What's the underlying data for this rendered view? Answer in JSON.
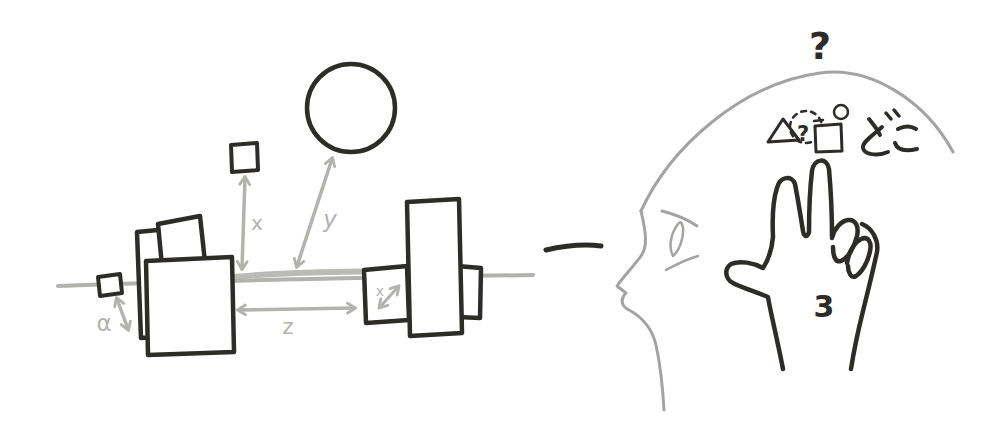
{
  "colors": {
    "ink": "#2e2c29",
    "sketch_gray": "#b2b2af",
    "head_gray": "#a3a3a1",
    "background": "#ffffff"
  },
  "scene": {
    "labels": {
      "alpha": "α",
      "x": "x",
      "y": "y",
      "z": "z",
      "x_inner": "x"
    }
  },
  "head": {
    "question_top": "?",
    "question_inner": "?",
    "japanese_text": "どこ",
    "finger_count": "3"
  }
}
